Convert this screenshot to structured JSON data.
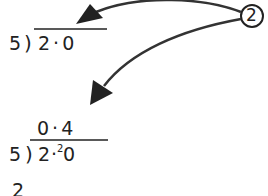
{
  "step_marker": {
    "label": "2"
  },
  "division_1": {
    "divisor": "5",
    "bracket": ")",
    "dividend": "2·0",
    "quotient": ""
  },
  "division_2": {
    "divisor": "5",
    "bracket": ")",
    "dividend_int": "2",
    "dividend_point": "·",
    "carry": "2",
    "dividend_frac": "0",
    "quotient": "0·4"
  },
  "partial_next_line": {
    "text": "2"
  },
  "colors": {
    "ink": "#222222",
    "arrow": "#333333",
    "background": "#ffffff"
  }
}
